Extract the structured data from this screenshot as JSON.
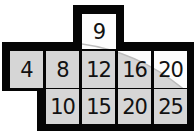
{
  "diagram": {
    "type": "connector-pinout",
    "colors": {
      "frame": "#050505",
      "cell": "#d6d6d6",
      "highlight": "#fdfdfd"
    },
    "top_tab": {
      "label": "9"
    },
    "row1": [
      {
        "label": "4"
      },
      {
        "label": "8"
      },
      {
        "label": "12"
      },
      {
        "label": "16"
      },
      {
        "label": "20"
      }
    ],
    "row2": [
      {
        "label": "10"
      },
      {
        "label": "15"
      },
      {
        "label": "20"
      },
      {
        "label": "25"
      }
    ]
  }
}
